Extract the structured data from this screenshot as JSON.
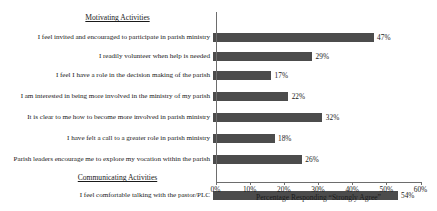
{
  "chart_data": {
    "type": "bar",
    "orientation": "horizontal",
    "title": "",
    "xlabel": "Percentage Responding “Strongly Agree”",
    "ylabel": "",
    "xlim": [
      0,
      60
    ],
    "xticks": [
      0,
      10,
      20,
      30,
      40,
      50,
      60
    ],
    "xtick_labels": [
      "0%",
      "10%",
      "20%",
      "30%",
      "40%",
      "50%",
      "60%"
    ],
    "grid": false,
    "legend": false,
    "bar_color": "#4c4c4c",
    "value_label_suffix": "%",
    "sections": [
      {
        "header": "Motivating Activities",
        "categories": [
          "I feel invited and encouraged to participate in parish ministry",
          "I readily volunteer when help is needed",
          "I feel I have a role in the decision making of the parish",
          "I am interested in being more involved in the ministry of my parish",
          "It is clear to me how to become more involved in parish ministry",
          "I have felt a call to a greater role in parish ministry",
          "Parish leaders encourage me to explore my vocation within the parish"
        ],
        "values": [
          47,
          29,
          17,
          22,
          32,
          18,
          26
        ]
      },
      {
        "header": "Communicating Activities",
        "categories": [
          "I feel comfortable talking with the pastor/PLC"
        ],
        "values": [
          54
        ]
      }
    ],
    "categories": [
      "I feel invited and encouraged to participate in parish ministry",
      "I readily volunteer when help is needed",
      "I feel I have a role in the decision making of the parish",
      "I am interested in being more involved in the ministry of my parish",
      "It is clear to me how to become more involved in parish ministry",
      "I have felt a call to a greater role in parish ministry",
      "Parish leaders encourage me to explore my vocation within the parish",
      "I feel comfortable talking with the pastor/PLC"
    ],
    "values": [
      47,
      29,
      17,
      22,
      32,
      18,
      26,
      54
    ],
    "value_labels": [
      "47%",
      "29%",
      "17%",
      "22%",
      "32%",
      "18%",
      "26%",
      "54%"
    ]
  },
  "rows": [
    {
      "kind": "header",
      "label": "Motivating Activities"
    },
    {
      "kind": "bar",
      "label": "I feel invited and encouraged to participate in parish ministry",
      "value": 47,
      "value_label": "47%"
    },
    {
      "kind": "bar",
      "label": "I readily volunteer when help is needed",
      "value": 29,
      "value_label": "29%"
    },
    {
      "kind": "bar",
      "label": "I feel I have a role in the decision making of the parish",
      "value": 17,
      "value_label": "17%"
    },
    {
      "kind": "bar",
      "label": "I am interested in being more involved in the ministry of my parish",
      "value": 22,
      "value_label": "22%"
    },
    {
      "kind": "bar",
      "label": "It is clear to me how to become more involved in parish ministry",
      "value": 32,
      "value_label": "32%"
    },
    {
      "kind": "bar",
      "label": "I have felt a call to a greater role in parish ministry",
      "value": 18,
      "value_label": "18%"
    },
    {
      "kind": "bar",
      "label": "Parish leaders encourage me to explore my vocation within the parish",
      "value": 26,
      "value_label": "26%"
    },
    {
      "kind": "header",
      "label": "Communicating Activities"
    },
    {
      "kind": "bar",
      "label": "I feel comfortable talking with the pastor/PLC",
      "value": 54,
      "value_label": "54%"
    }
  ]
}
